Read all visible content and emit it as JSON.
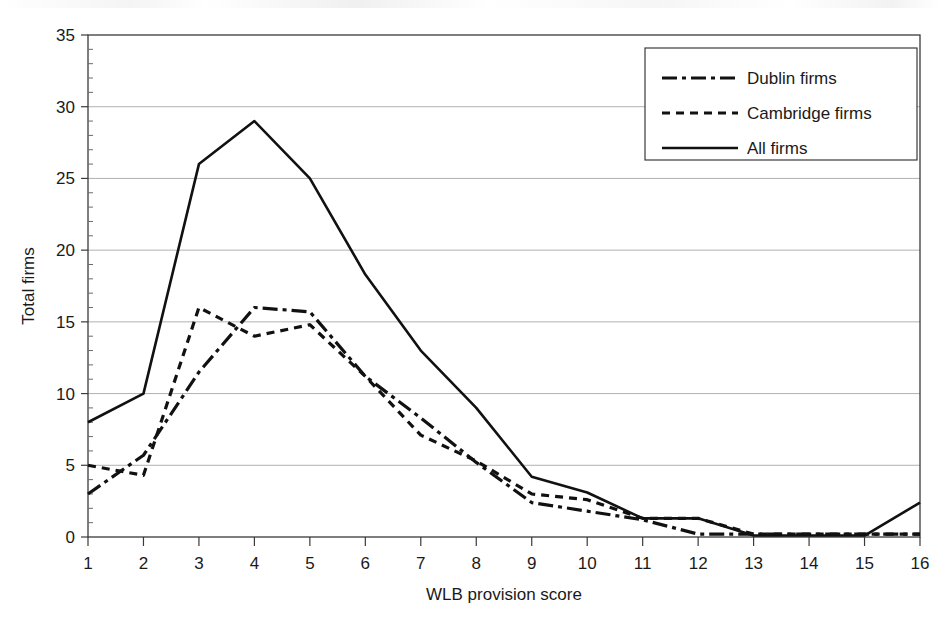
{
  "chart_data": {
    "type": "line",
    "title": "",
    "xlabel": "WLB provision score",
    "ylabel": "Total firms",
    "xlim": [
      1,
      16
    ],
    "ylim": [
      0,
      35
    ],
    "ytick_step": 5,
    "yticks": [
      0,
      5,
      10,
      15,
      20,
      25,
      30,
      35
    ],
    "xticks": [
      1,
      2,
      3,
      4,
      5,
      6,
      7,
      8,
      9,
      10,
      11,
      12,
      13,
      14,
      15,
      16
    ],
    "grid": "horizontal",
    "legend_position": "top-right",
    "x": [
      1,
      2,
      3,
      4,
      5,
      6,
      7,
      8,
      9,
      10,
      11,
      12,
      13,
      14,
      15,
      16
    ],
    "series": [
      {
        "name": "Dublin firms",
        "style": "dash-dot",
        "values": [
          3,
          5.7,
          11.5,
          16,
          15.7,
          11.2,
          8.3,
          5.2,
          2.4,
          1.8,
          1.2,
          0.2,
          0.2,
          0.2,
          0.2,
          0.2
        ]
      },
      {
        "name": "Cambridge firms",
        "style": "dotted",
        "values": [
          5,
          4.3,
          16,
          14,
          14.8,
          11.2,
          7.1,
          5.3,
          3.0,
          2.6,
          1.3,
          1.3,
          0.2,
          0.2,
          0.2,
          0.2
        ]
      },
      {
        "name": "All firms",
        "style": "solid",
        "values": [
          8,
          10,
          26,
          29,
          25,
          18.3,
          13,
          9,
          4.2,
          3.1,
          1.3,
          1.3,
          0.1,
          0.1,
          0.1,
          2.4
        ]
      }
    ]
  },
  "axes": {
    "x_title": "WLB provision score",
    "y_title": "Total firms",
    "y_tick_labels": [
      "0",
      "5",
      "10",
      "15",
      "20",
      "25",
      "30",
      "35"
    ],
    "x_tick_labels": [
      "1",
      "2",
      "3",
      "4",
      "5",
      "6",
      "7",
      "8",
      "9",
      "10",
      "11",
      "12",
      "13",
      "14",
      "15",
      "16"
    ]
  },
  "legend": {
    "entries": [
      {
        "label": "Dublin firms",
        "style": "dash-dot"
      },
      {
        "label": "Cambridge firms",
        "style": "dotted"
      },
      {
        "label": "All firms",
        "style": "solid"
      }
    ]
  },
  "colors": {
    "line": "#111111",
    "grid": "#a8a8a8",
    "frame": "#3a3a3a",
    "background": "#ffffff"
  }
}
